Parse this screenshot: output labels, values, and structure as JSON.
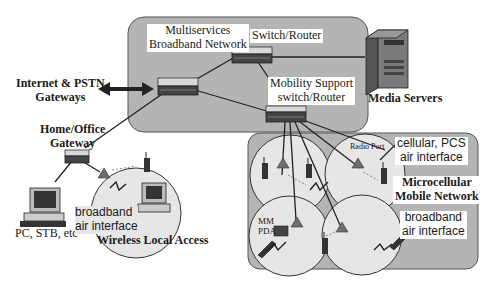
{
  "diagram": {
    "regions": {
      "core_network": {
        "label_line1": "Multiservices",
        "label_line2": "Broadband Network",
        "fill": "#b4b4b4"
      },
      "microcellular": {
        "label_line1": "Microcellular",
        "label_line2": "Mobile Network",
        "fill": "#b4b4b4"
      },
      "wireless_local": {
        "label": "Wireless Local Access",
        "fill": "#e6e6e6"
      }
    },
    "nodes": {
      "switch_router": "Switch/Router",
      "mobility_switch": {
        "line1": "Mobility Support",
        "line2": "switch/Router"
      },
      "media_servers": "Media Servers",
      "internet_gateways": {
        "line1": "Internet & PSTN",
        "line2": "Gateways"
      },
      "home_gateway": {
        "line1": "Home/Office",
        "line2": "Gateway"
      },
      "pc": "PC, STB, etc",
      "radio_port": "Radio Port",
      "mm_pda": {
        "line1": "MM",
        "line2": "PDA"
      }
    },
    "annotations": {
      "wla_air": {
        "line1": "broadband",
        "line2": "air interface"
      },
      "cellular_air": {
        "line1": "cellular, PCS",
        "line2": "air interface"
      },
      "micro_broadband_air": {
        "line1": "broadband",
        "line2": "air interface"
      }
    },
    "colors": {
      "line": "#222222",
      "radio_port": "#6e6e6e",
      "device_dark": "#333333",
      "device_light": "#cfcfcf"
    }
  }
}
